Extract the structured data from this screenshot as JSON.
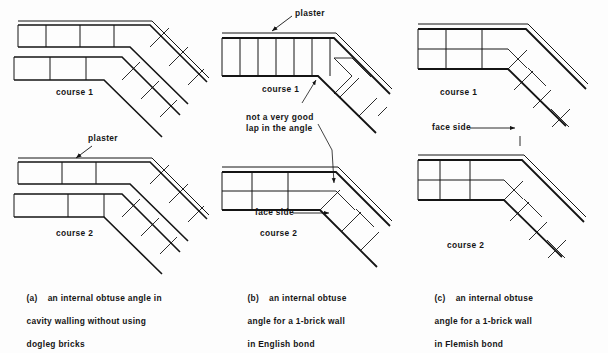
{
  "figure": {
    "background_color": "#fdfdfd",
    "line_color": "#141414",
    "panels": [
      {
        "key": "a",
        "caption_marker": "(a)",
        "caption_text": "an internal obtuse angle in\ncavity walling without using\ndogleg bricks",
        "course_top": "course 1",
        "course_bottom": "course 2",
        "annotations": [
          "plaster"
        ]
      },
      {
        "key": "b",
        "caption_marker": "(b)",
        "caption_text": "an internal obtuse\nangle for a 1-brick wall\nin English bond",
        "course_top": "course 1",
        "course_bottom": "course 2",
        "annotations": [
          "plaster",
          "not a very good\nlap in the angle",
          "face side"
        ]
      },
      {
        "key": "c",
        "caption_marker": "(c)",
        "caption_text": "an internal obtuse\nangle for a 1-brick wall\nin Flemish bond",
        "course_top": "course 1",
        "course_bottom": "course 2",
        "annotations": [
          "face side"
        ]
      }
    ]
  },
  "labels": {
    "plaster_left": "plaster",
    "plaster_mid": "plaster",
    "not_good_lap": "not a very good",
    "not_good_lap_2": "lap in the angle",
    "face_side_mid": "face side",
    "face_side_right": "face side",
    "course1_left": "course 1",
    "course2_left": "course 2",
    "course1_mid": "course 1",
    "course2_mid": "course 2",
    "course1_right": "course 1",
    "course2_right": "course 2"
  },
  "captions": {
    "a_marker": "(a)",
    "a_line1": "an internal obtuse angle in",
    "a_line2": "cavity walling without using",
    "a_line3": "dogleg bricks",
    "b_marker": "(b)",
    "b_line1": "an internal obtuse",
    "b_line2": "angle for a 1-brick wall",
    "b_line3": "in English bond",
    "c_marker": "(c)",
    "c_line1": "an internal obtuse",
    "c_line2": "angle for a 1-brick wall",
    "c_line3": "in Flemish bond"
  }
}
